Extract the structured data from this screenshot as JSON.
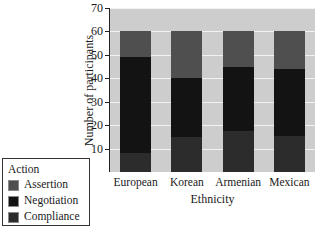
{
  "chart_data": {
    "type": "bar",
    "subtype": "stacked-bar",
    "title": "",
    "xlabel": "Ethnicity",
    "ylabel": "Number of participants",
    "categories": [
      "European",
      "Korean",
      "Armenian",
      "Mexican"
    ],
    "series": [
      {
        "name": "Assertion",
        "color": "#4f4f4f",
        "values": [
          11,
          20,
          15,
          16
        ]
      },
      {
        "name": "Negotiation",
        "color": "#131313",
        "values": [
          41,
          25,
          27.5,
          28.5
        ]
      },
      {
        "name": "Compliance",
        "color": "#2c2c2c",
        "values": [
          8,
          15,
          17.5,
          15.5
        ]
      }
    ],
    "stack_totals": [
      60,
      60,
      60,
      60
    ],
    "ylim": [
      0,
      70
    ],
    "yticks": [
      10,
      20,
      30,
      40,
      50,
      60,
      70
    ],
    "ytick_labels": [
      "10",
      "20",
      "30",
      "40",
      "50",
      "60",
      "70"
    ],
    "grid": true,
    "grid_color": "#f2f2f2",
    "plot_background": "#cdcdcd",
    "legend_position": "bottom-left",
    "legend_title": "Action",
    "legend_entries": [
      "Assertion",
      "Negotiation",
      "Compliance"
    ]
  }
}
